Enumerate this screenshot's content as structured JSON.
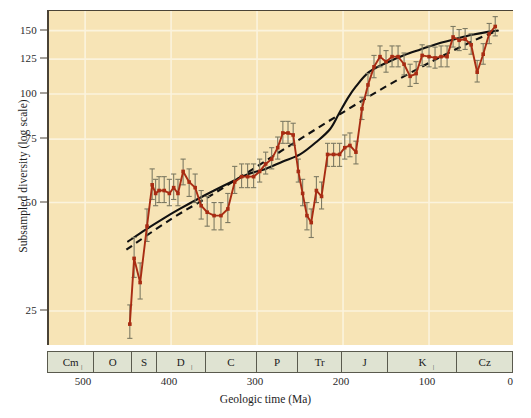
{
  "chart_data": {
    "type": "line",
    "title": "",
    "xlabel": "Geologic time (Ma)",
    "ylabel": "Subsampled diversity (log scale)",
    "y_scale": "log",
    "xlim": [
      542,
      0
    ],
    "ylim": [
      20,
      170
    ],
    "grid": true,
    "legend": "none",
    "y_ticks": [
      25,
      50,
      75,
      100,
      125,
      150
    ],
    "x_ticks": [
      500,
      400,
      300,
      200,
      100,
      0
    ],
    "background_color": "#f7e4b6",
    "gridline_color": "#fbf3dd",
    "series": [
      {
        "name": "Subsampled diversity",
        "style": "line-with-points-and-error-bars",
        "color": "#a82c13",
        "x": [
          448,
          443,
          436,
          428,
          422,
          418,
          414,
          408,
          402,
          397,
          392,
          386,
          379,
          372,
          365,
          358,
          350,
          342,
          334,
          326,
          318,
          311,
          304,
          297,
          290,
          283,
          276,
          270,
          264,
          258,
          252,
          247,
          242,
          237,
          231,
          225,
          218,
          211,
          204,
          198,
          192,
          185,
          178,
          171,
          164,
          157,
          150,
          143,
          136,
          129,
          122,
          115,
          108,
          100,
          93,
          86,
          79,
          72,
          65,
          58,
          51,
          44,
          37,
          30,
          23
        ],
        "y": [
          23,
          35,
          30,
          43,
          56,
          53,
          54,
          54,
          53,
          55,
          53,
          61,
          57,
          55,
          49,
          47,
          46,
          46,
          48,
          57,
          59,
          59,
          59,
          61,
          64,
          66,
          71,
          78,
          78,
          77,
          61,
          53,
          46,
          44,
          54,
          52,
          68,
          68,
          68,
          71,
          72,
          69,
          91,
          106,
          119,
          127,
          123,
          127,
          127,
          121,
          112,
          114,
          128,
          127,
          126,
          127,
          127,
          144,
          141,
          142,
          137,
          115,
          129,
          147,
          154
        ],
        "y_err": [
          [
            21,
            26
          ],
          [
            31,
            40
          ],
          [
            27,
            34
          ],
          [
            39,
            48
          ],
          [
            51,
            62
          ],
          [
            49,
            58
          ],
          [
            50,
            59
          ],
          [
            50,
            59
          ],
          [
            49,
            58
          ],
          [
            51,
            60
          ],
          [
            49,
            58
          ],
          [
            56,
            66
          ],
          [
            52,
            62
          ],
          [
            50,
            60
          ],
          [
            45,
            54
          ],
          [
            43,
            52
          ],
          [
            42,
            50
          ],
          [
            42,
            50
          ],
          [
            44,
            53
          ],
          [
            53,
            63
          ],
          [
            55,
            64
          ],
          [
            55,
            64
          ],
          [
            55,
            64
          ],
          [
            57,
            66
          ],
          [
            60,
            69
          ],
          [
            62,
            71
          ],
          [
            66,
            76
          ],
          [
            73,
            84
          ],
          [
            73,
            84
          ],
          [
            72,
            83
          ],
          [
            57,
            66
          ],
          [
            49,
            58
          ],
          [
            42,
            50
          ],
          [
            40,
            48
          ],
          [
            50,
            59
          ],
          [
            48,
            57
          ],
          [
            63,
            73
          ],
          [
            63,
            73
          ],
          [
            63,
            73
          ],
          [
            66,
            77
          ],
          [
            67,
            78
          ],
          [
            64,
            74
          ],
          [
            85,
            98
          ],
          [
            99,
            114
          ],
          [
            111,
            128
          ],
          [
            119,
            136
          ],
          [
            115,
            132
          ],
          [
            119,
            136
          ],
          [
            119,
            136
          ],
          [
            113,
            130
          ],
          [
            105,
            121
          ],
          [
            107,
            123
          ],
          [
            120,
            137
          ],
          [
            119,
            136
          ],
          [
            118,
            135
          ],
          [
            119,
            136
          ],
          [
            119,
            136
          ],
          [
            135,
            154
          ],
          [
            132,
            151
          ],
          [
            133,
            152
          ],
          [
            129,
            147
          ],
          [
            108,
            124
          ],
          [
            121,
            138
          ],
          [
            138,
            157
          ],
          [
            145,
            164
          ]
        ]
      },
      {
        "name": "Solid trend curve",
        "style": "solid",
        "color": "#111111",
        "x": [
          450,
          430,
          410,
          390,
          370,
          350,
          330,
          310,
          290,
          270,
          250,
          230,
          215,
          205,
          195,
          185,
          170,
          150,
          130,
          110,
          90,
          70,
          50,
          30,
          20
        ],
        "y": [
          39,
          42,
          45,
          48,
          51,
          54,
          57,
          60,
          62,
          65,
          68,
          74,
          80,
          88,
          97,
          105,
          115,
          122,
          128,
          133,
          138,
          142,
          146,
          149,
          150
        ]
      },
      {
        "name": "Dashed trend line",
        "style": "dashed",
        "color": "#111111",
        "x": [
          452,
          400,
          350,
          300,
          250,
          200,
          150,
          100,
          50,
          20
        ],
        "y": [
          37,
          45,
          53,
          63,
          75,
          89,
          105,
          122,
          140,
          150
        ]
      }
    ],
    "periods": [
      {
        "label": "Cm",
        "start": 542,
        "end": 488,
        "subscript_tick": true
      },
      {
        "label": "O",
        "start": 488,
        "end": 444,
        "subscript_tick": false
      },
      {
        "label": "S",
        "start": 444,
        "end": 416,
        "subscript_tick": false
      },
      {
        "label": "D",
        "start": 416,
        "end": 359,
        "subscript_tick": true
      },
      {
        "label": "C",
        "start": 359,
        "end": 299,
        "subscript_tick": false
      },
      {
        "label": "P",
        "start": 299,
        "end": 251,
        "subscript_tick": false
      },
      {
        "label": "Tr",
        "start": 251,
        "end": 200,
        "subscript_tick": false
      },
      {
        "label": "J",
        "start": 200,
        "end": 146,
        "subscript_tick": false
      },
      {
        "label": "K",
        "start": 146,
        "end": 65,
        "subscript_tick": true
      },
      {
        "label": "Cz",
        "start": 65,
        "end": 0,
        "subscript_tick": false
      }
    ]
  },
  "axes": {
    "y_title": "Subsampled diversity (log scale)",
    "x_title": "Geologic time (Ma)",
    "y_tick_labels": [
      "150",
      "125",
      "100",
      "75",
      "50",
      "25"
    ],
    "x_tick_labels": [
      "500",
      "400",
      "300",
      "200",
      "100",
      "0"
    ]
  },
  "period_labels": [
    "Cm",
    "O",
    "S",
    "D",
    "C",
    "P",
    "Tr",
    "J",
    "K",
    "Cz"
  ],
  "caption": ""
}
